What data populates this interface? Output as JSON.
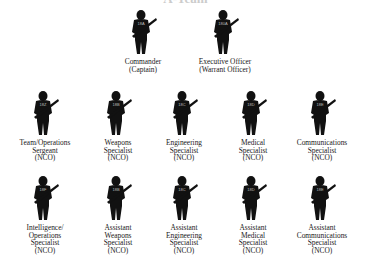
{
  "title": "A-Team",
  "members": [
    {
      "badge": "18A",
      "lines": [
        "Commander",
        "(Captain)"
      ],
      "x": 143,
      "y": 10
    },
    {
      "badge": "180A",
      "lines": [
        "Executive Officer",
        "(Warrant Officer)"
      ],
      "x": 225,
      "y": 10
    },
    {
      "badge": "18Z",
      "lines": [
        "Team/Operations",
        "Sergeant",
        "(NCO)"
      ],
      "x": 45,
      "y": 91
    },
    {
      "badge": "18B",
      "lines": [
        "Weapons",
        "Specialist",
        "(NCO)"
      ],
      "x": 118,
      "y": 91
    },
    {
      "badge": "18C",
      "lines": [
        "Engineering",
        "Specialist",
        "(NCO)"
      ],
      "x": 184,
      "y": 91
    },
    {
      "badge": "18D",
      "lines": [
        "Medical",
        "Specialist",
        "(NCO)"
      ],
      "x": 253,
      "y": 91
    },
    {
      "badge": "18E",
      "lines": [
        "Communications",
        "Specialist",
        "(NCO)"
      ],
      "x": 322,
      "y": 91
    },
    {
      "badge": "18F",
      "lines": [
        "Intelligence/",
        "Operations",
        "Specialist",
        "(NCO)"
      ],
      "x": 45,
      "y": 176
    },
    {
      "badge": "18B",
      "lines": [
        "Assistant",
        "Weapons",
        "Specialist",
        "(NCO)"
      ],
      "x": 118,
      "y": 176
    },
    {
      "badge": "18C",
      "lines": [
        "Assistant",
        "Engineering",
        "Specialist",
        "(NCO)"
      ],
      "x": 184,
      "y": 176
    },
    {
      "badge": "18D",
      "lines": [
        "Assistant",
        "Medical",
        "Specialist",
        "(NCO)"
      ],
      "x": 253,
      "y": 176
    },
    {
      "badge": "18E",
      "lines": [
        "Assistant",
        "Communications",
        "Specialist",
        "(NCO)"
      ],
      "x": 322,
      "y": 176
    }
  ]
}
